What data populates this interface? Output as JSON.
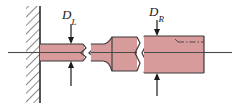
{
  "figure": {
    "type": "engineering-diagram",
    "background_color": "#ffffff"
  },
  "labels": {
    "left_diameter": {
      "symbol": "D",
      "subscript": "L",
      "full_text": "D_L"
    },
    "right_diameter": {
      "symbol": "D",
      "subscript": "R",
      "full_text": "D_R"
    }
  },
  "colors": {
    "shaft_fill": "#d89b9b",
    "shaft_fill_light": "#e0acac",
    "outline": "#3a3a3a",
    "hatch": "#2b2b2b",
    "centerline": "#4a4a4a",
    "label_text": "#1a1a1a"
  },
  "elements": {
    "wall": {
      "name": "fixed-support-wall",
      "hatching": "diagonal"
    },
    "left_shaft": {
      "name": "left-shaft-segment",
      "diameter_label": "D_L"
    },
    "fillet": {
      "name": "fillet-transition"
    },
    "right_shaft": {
      "name": "right-shaft-segment",
      "diameter_label": "D_R"
    },
    "break_lines": {
      "name": "break-line",
      "count": 2
    },
    "centerline": {
      "name": "axis-centerline"
    },
    "hidden_line": {
      "name": "hidden-dash-dot-line"
    },
    "dimension_arrows": {
      "name": "diameter-dimension-arrow",
      "count": 4
    }
  }
}
